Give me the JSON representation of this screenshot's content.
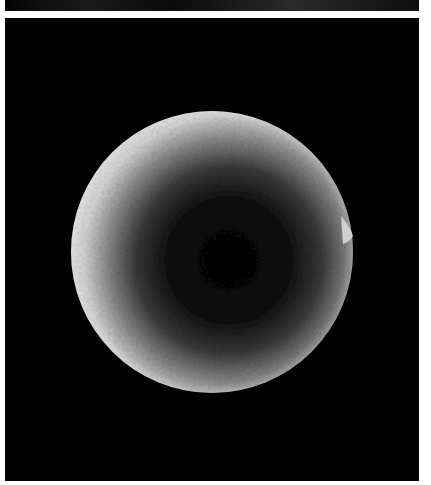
{
  "image": {
    "description": "Scanning electron micrograph of a single spherical particle with textured surface, bright rim and dark center, on black background",
    "panels": [
      {
        "name": "top-panel-strip",
        "content": "cropped bottom edge of previous micrograph"
      },
      {
        "name": "main-panel",
        "content": "spherical particle micrograph"
      }
    ],
    "colors": {
      "background": "#000000",
      "page": "#ffffff",
      "rim": "#e8e8e8",
      "center": "#050505"
    }
  }
}
